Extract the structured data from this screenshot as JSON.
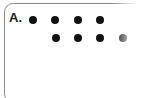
{
  "option": {
    "letter": "A.",
    "frame_color": "#8d8d8d",
    "dot_color": "#111111",
    "background_color": "#ffffff"
  },
  "chart_data": {
    "type": "scatter",
    "title": "",
    "xlabel": "",
    "ylabel": "",
    "rows": [
      {
        "name": "top-row",
        "count": 4,
        "columns": [
          1,
          2,
          3,
          4
        ],
        "dots": [
          {
            "x": 33,
            "y": 20,
            "r": 4
          },
          {
            "x": 55,
            "y": 20,
            "r": 4
          },
          {
            "x": 78,
            "y": 20,
            "r": 4
          },
          {
            "x": 100,
            "y": 20,
            "r": 4
          }
        ]
      },
      {
        "name": "bottom-row",
        "count": 4,
        "columns": [
          2,
          3,
          4,
          5
        ],
        "dots": [
          {
            "x": 56,
            "y": 38,
            "r": 4
          },
          {
            "x": 78,
            "y": 38,
            "r": 4
          },
          {
            "x": 100,
            "y": 38,
            "r": 4
          },
          {
            "x": 123,
            "y": 38,
            "r": 4
          }
        ]
      }
    ],
    "total_dots": 8,
    "dot_radius": 4,
    "column_spacing": 22,
    "row_spacing": 18
  }
}
